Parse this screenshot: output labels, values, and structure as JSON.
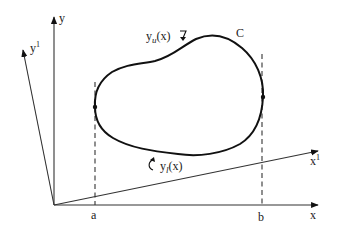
{
  "diagram": {
    "axes": {
      "x_label": "x",
      "y_label": "y",
      "x1_label": "x",
      "x1_superscript": "1",
      "y1_label": "y",
      "y1_superscript": "1"
    },
    "bounds": {
      "a_label": "a",
      "b_label": "b"
    },
    "curve": {
      "name_label": "C",
      "upper": {
        "base": "y",
        "subscript": "u",
        "arg": "(x)"
      },
      "lower": {
        "base": "y",
        "subscript": "l",
        "arg": "(x)"
      }
    }
  }
}
